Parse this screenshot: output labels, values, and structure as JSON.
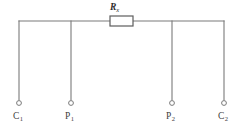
{
  "diagram": {
    "geometry": {
      "width": 238,
      "height": 134,
      "bus_y": 21,
      "terminal_y": 103,
      "left_x": 19,
      "right_x": 224,
      "columns_x": [
        19,
        71,
        172,
        224
      ],
      "terminal_radius": 2.4,
      "resistor": {
        "x": 110,
        "y": 16,
        "w": 23,
        "h": 10
      }
    },
    "colors": {
      "wire": "#7a7a7a",
      "resistor_stroke": "#5d5d5d",
      "terminal_fill": "#ffffff",
      "label_text": "#3d3d3d",
      "background": "#ffffff"
    },
    "component": {
      "name": "resistor",
      "label_main": "R",
      "label_sub": "x"
    },
    "terminals": [
      {
        "id": "c1",
        "label_main": "C",
        "label_sub": "1",
        "label_x": 13,
        "label_y": 112
      },
      {
        "id": "p1",
        "label_main": "P",
        "label_sub": "1",
        "label_x": 65,
        "label_y": 112
      },
      {
        "id": "p2",
        "label_main": "P",
        "label_sub": "2",
        "label_x": 166,
        "label_y": 112
      },
      {
        "id": "c2",
        "label_main": "C",
        "label_sub": "2",
        "label_x": 218,
        "label_y": 112
      }
    ]
  }
}
